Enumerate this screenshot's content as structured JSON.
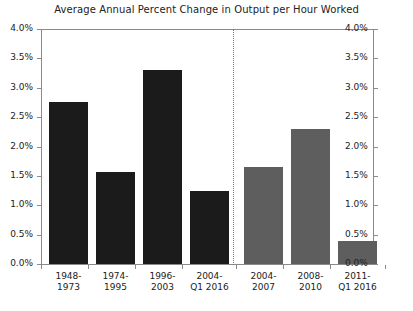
{
  "chart_data": {
    "type": "bar",
    "title": "Average Annual Percent Change in Output per Hour Worked",
    "xlabel": "",
    "ylabel": "",
    "ylim": [
      0,
      4
    ],
    "grid": false,
    "legend": null,
    "axis_tick_labels": [
      "0.0%",
      "0.5%",
      "1.0%",
      "1.5%",
      "2.0%",
      "2.5%",
      "3.0%",
      "3.5%",
      "4.0%"
    ],
    "axis_tick_values": [
      0,
      0.5,
      1.0,
      1.5,
      2.0,
      2.5,
      3.0,
      3.5,
      4.0
    ],
    "left_axis_labels": [
      "4.0%",
      "3.5%",
      "3.0%",
      "2.5%",
      "2.0%",
      "1.5%",
      "1.0%",
      "0.5%",
      "0.0%"
    ],
    "right_axis_labels": [
      "4.0%",
      "3.5%",
      "3.0%",
      "2.5%",
      "2.0%",
      "1.5%",
      "1.0%",
      "0.5%",
      "0.0%"
    ],
    "divider": true,
    "groups": [
      {
        "name": "long-run-periods",
        "color": "#1b1b1b",
        "categories": [
          "1948-1973",
          "1974-1995",
          "1996-2003",
          "2004-Q1 2016"
        ],
        "values": [
          2.75,
          1.57,
          3.3,
          1.25
        ]
      },
      {
        "name": "recent-periods",
        "color": "#5e5e5e",
        "categories": [
          "2004-2007",
          "2008-2010",
          "2011-Q1 2016"
        ],
        "values": [
          1.65,
          2.3,
          0.4
        ]
      }
    ],
    "categories": [
      "1948-1973",
      "1974-1995",
      "1996-2003",
      "2004-Q1 2016",
      "2004-2007",
      "2008-2010",
      "2011-Q1 2016"
    ],
    "values": [
      2.75,
      1.57,
      3.3,
      1.25,
      1.65,
      2.3,
      0.4
    ],
    "bars": [
      {
        "label_line1": "1948-",
        "label_line2": "1973",
        "value": 2.75,
        "style": "dark"
      },
      {
        "label_line1": "1974-",
        "label_line2": "1995",
        "value": 1.57,
        "style": "dark"
      },
      {
        "label_line1": "1996-",
        "label_line2": "2003",
        "value": 3.3,
        "style": "dark"
      },
      {
        "label_line1": "2004-",
        "label_line2": "Q1 2016",
        "value": 1.25,
        "style": "dark"
      },
      {
        "label_line1": "2004-",
        "label_line2": "2007",
        "value": 1.65,
        "style": "gray"
      },
      {
        "label_line1": "2008-",
        "label_line2": "2010",
        "value": 2.3,
        "style": "gray"
      },
      {
        "label_line1": "2011-",
        "label_line2": "Q1 2016",
        "value": 0.4,
        "style": "gray"
      }
    ]
  }
}
